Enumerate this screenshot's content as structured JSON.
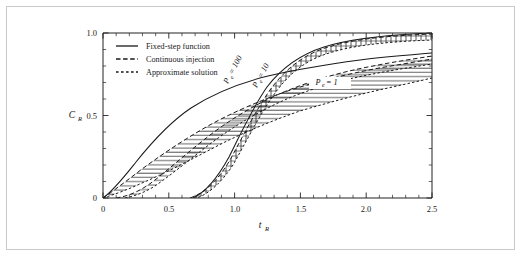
{
  "figure": {
    "border_color": "#c9c9c9",
    "background": "#ffffff"
  },
  "axes": {
    "x": {
      "title": "t",
      "title_sub": "R",
      "ticklabels": [
        "0",
        "0.5",
        "1.0",
        "1.5",
        "2.0",
        "2.5"
      ],
      "tickvalues": [
        0,
        0.5,
        1.0,
        1.5,
        2.0,
        2.5
      ],
      "range": [
        0,
        2.5
      ],
      "minor_per_major": 5
    },
    "y": {
      "title": "C",
      "title_sub": "R",
      "ticklabels": [
        "0",
        "0.5",
        "1.0"
      ],
      "tickvalues": [
        0,
        0.5,
        1.0
      ],
      "range": [
        0,
        1.0
      ],
      "minor_per_major": 5
    }
  },
  "legend": {
    "items": [
      {
        "label": "Fixed-step function",
        "style": "solid"
      },
      {
        "label": "Continuous injection",
        "style": "dashed-long"
      },
      {
        "label": "Approximate solution",
        "style": "dashed-short"
      }
    ]
  },
  "annotations": [
    {
      "id": "pe-100",
      "text": "P",
      "sub": "e",
      "tail": " = 100",
      "rotation": -62
    },
    {
      "id": "pe-10",
      "text": "P",
      "sub": "e",
      "tail": " = 10",
      "rotation": -62
    },
    {
      "id": "pe-1",
      "text": "P",
      "sub": "e",
      "tail": " = 1",
      "rotation": 0
    }
  ],
  "chart_data": {
    "type": "line",
    "title": "",
    "xlabel": "t_R",
    "ylabel": "C_R",
    "xlim": [
      0,
      2.5
    ],
    "ylim": [
      0,
      1.0
    ],
    "grid": false,
    "legend_position": "upper-left",
    "x": [
      0,
      0.1,
      0.2,
      0.3,
      0.4,
      0.5,
      0.6,
      0.7,
      0.8,
      0.9,
      1.0,
      1.1,
      1.2,
      1.3,
      1.4,
      1.5,
      1.6,
      1.7,
      1.8,
      1.9,
      2.0,
      2.1,
      2.2,
      2.3,
      2.4,
      2.5
    ],
    "series": [
      {
        "name": "Pe = 1, continuous injection",
        "style": "dashed-long",
        "values": [
          0.0,
          0.055,
          0.115,
          0.175,
          0.232,
          0.287,
          0.338,
          0.385,
          0.428,
          0.468,
          0.504,
          0.537,
          0.567,
          0.595,
          0.62,
          0.643,
          0.664,
          0.683,
          0.701,
          0.717,
          0.732,
          0.746,
          0.759,
          0.771,
          0.782,
          0.792
        ]
      },
      {
        "name": "Pe = 1, approximate solution",
        "style": "dashed-short",
        "values": [
          0.0,
          0.018,
          0.048,
          0.085,
          0.124,
          0.164,
          0.204,
          0.243,
          0.28,
          0.315,
          0.348,
          0.379,
          0.408,
          0.435,
          0.46,
          0.484,
          0.506,
          0.527,
          0.546,
          0.564,
          0.581,
          0.597,
          0.612,
          0.626,
          0.639,
          0.652
        ]
      },
      {
        "name": "Pe = 10, continuous injection",
        "style": "dashed-long",
        "values": [
          0.0,
          0.01,
          0.042,
          0.096,
          0.165,
          0.24,
          0.316,
          0.389,
          0.455,
          0.514,
          0.566,
          0.611,
          0.65,
          0.684,
          0.713,
          0.738,
          0.76,
          0.779,
          0.796,
          0.811,
          0.824,
          0.836,
          0.846,
          0.856,
          0.864,
          0.872
        ]
      },
      {
        "name": "Pe = 10, approximate solution",
        "style": "dashed-short",
        "values": [
          0.0,
          0.002,
          0.012,
          0.038,
          0.08,
          0.135,
          0.198,
          0.265,
          0.331,
          0.394,
          0.452,
          0.505,
          0.552,
          0.594,
          0.631,
          0.663,
          0.692,
          0.717,
          0.739,
          0.759,
          0.776,
          0.792,
          0.806,
          0.818,
          0.829,
          0.839
        ]
      },
      {
        "name": "Pe = 100, continuous injection",
        "style": "dashed-long",
        "values": [
          0.0,
          0.0,
          0.0,
          0.001,
          0.006,
          0.026,
          0.079,
          0.183,
          0.33,
          0.49,
          0.63,
          0.736,
          0.81,
          0.86,
          0.895,
          0.918,
          0.934,
          0.946,
          0.955,
          0.962,
          0.967,
          0.971,
          0.975,
          0.978,
          0.98,
          0.982
        ]
      },
      {
        "name": "Pe = 100, approximate solution",
        "style": "dashed-short",
        "values": [
          0.0,
          0.0,
          0.0,
          0.0,
          0.002,
          0.012,
          0.048,
          0.132,
          0.268,
          0.432,
          0.584,
          0.703,
          0.788,
          0.846,
          0.885,
          0.912,
          0.93,
          0.944,
          0.954,
          0.961,
          0.967,
          0.972,
          0.976,
          0.979,
          0.981,
          0.983
        ]
      },
      {
        "name": "Fixed-step function",
        "style": "solid",
        "values": [
          0.0,
          0.052,
          0.14,
          0.244,
          0.348,
          0.444,
          0.528,
          0.6,
          0.66,
          0.71,
          0.752,
          0.786,
          0.814,
          0.838,
          0.858,
          0.874,
          0.888,
          0.9,
          0.91,
          0.919,
          0.926,
          0.933,
          0.938,
          0.943,
          0.947,
          0.951
        ]
      },
      {
        "name": "Fixed-step function (Pe = 100 branch)",
        "style": "solid",
        "values": [
          0.0,
          0.0,
          0.0,
          0.0,
          0.001,
          0.008,
          0.04,
          0.122,
          0.262,
          0.43,
          0.588,
          0.712,
          0.8,
          0.858,
          0.896,
          0.921,
          0.938,
          0.95,
          0.958,
          0.964,
          0.969,
          0.973,
          0.976,
          0.979,
          0.981,
          0.983
        ]
      }
    ]
  }
}
